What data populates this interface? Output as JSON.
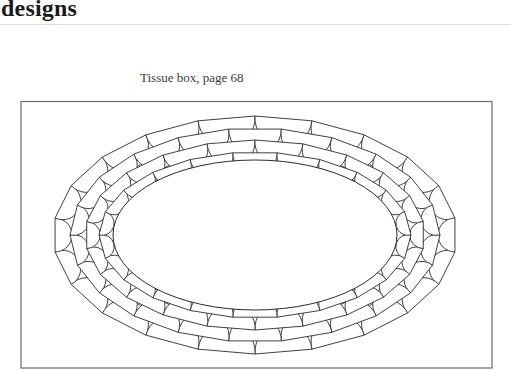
{
  "header": {
    "title": "designs"
  },
  "figure": {
    "caption": "Tissue box, page 68",
    "frame": {
      "x": 21,
      "y": 101.5,
      "width": 471,
      "height": 266.5
    },
    "center": {
      "x": 255,
      "y": 235
    },
    "inner_ellipse": {
      "rx": 142,
      "ry": 75
    },
    "rings": [
      {
        "rx": 160,
        "ry": 85,
        "count": 22,
        "offset": 0.5
      },
      {
        "rx": 174,
        "ry": 97,
        "count": 22,
        "offset": 0.0
      },
      {
        "rx": 188,
        "ry": 109,
        "count": 22,
        "offset": 0.5
      },
      {
        "rx": 203,
        "ry": 121,
        "count": 22,
        "offset": 0.0
      },
      {
        "rx": 220,
        "ry": 133,
        "count": 22,
        "offset": 0.5
      }
    ],
    "stroke_color": "#2b2b2b",
    "frame_color": "#6a6a6a"
  }
}
